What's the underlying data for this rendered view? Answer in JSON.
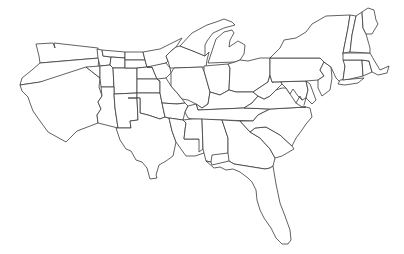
{
  "map": {
    "type": "us-states-outline",
    "background_color": "#ffffff",
    "stroke_color": "#3a3a3a",
    "fill_color": "#ffffff",
    "labels_visible": false,
    "region_count": 48,
    "regions": [
      "washington",
      "oregon",
      "california",
      "idaho",
      "nevada",
      "montana",
      "wyoming",
      "utah",
      "arizona",
      "colorado",
      "new-mexico",
      "north-dakota",
      "south-dakota",
      "nebraska",
      "kansas",
      "oklahoma",
      "texas",
      "minnesota",
      "iowa",
      "missouri",
      "arkansas",
      "louisiana",
      "wisconsin",
      "illinois",
      "michigan",
      "indiana",
      "ohio",
      "kentucky",
      "tennessee",
      "mississippi",
      "alabama",
      "georgia",
      "florida",
      "south-carolina",
      "north-carolina",
      "virginia",
      "west-virginia",
      "maryland",
      "delaware",
      "pennsylvania",
      "new-jersey",
      "new-york",
      "connecticut",
      "rhode-island",
      "massachusetts",
      "vermont",
      "new-hampshire",
      "maine"
    ]
  }
}
